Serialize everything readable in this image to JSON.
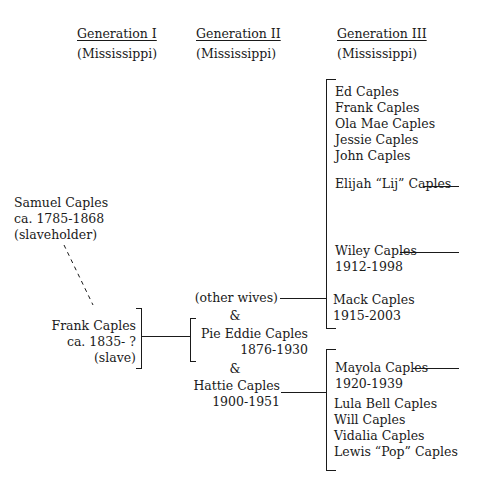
{
  "headers": [
    {
      "title": "Generation I",
      "region": "(Mississippi)"
    },
    {
      "title": "Generation II",
      "region": "(Mississippi)"
    },
    {
      "title": "Generation III",
      "region": "(Mississippi)"
    }
  ],
  "generation1": {
    "samuel": {
      "name": "Samuel Caples",
      "dates": "ca. 1785-1868",
      "note": "(slaveholder)"
    },
    "frank": {
      "name": "Frank Caples",
      "dates": "ca. 1835- ?",
      "note": "(slave)"
    }
  },
  "generation2": {
    "other_wives": "(other wives)",
    "amp1": "&",
    "pie": {
      "name": "Pie Eddie Caples",
      "dates": "1876-1930"
    },
    "amp2": "&",
    "hattie": {
      "name": "Hattie Caples",
      "dates": "1900-1951"
    }
  },
  "generation3": {
    "group1": [
      "Ed Caples",
      "Frank Caples",
      "Ola Mae Caples",
      "Jessie Caples",
      "John Caples"
    ],
    "elijah": "Elijah “Lij” Caples",
    "wiley": {
      "name": "Wiley Caples",
      "dates": "1912-1998"
    },
    "mack": {
      "name": "Mack Caples",
      "dates": "1915-2003"
    },
    "mayola": {
      "name": "Mayola Caples",
      "dates": "1920-1939"
    },
    "group2": [
      "Lula Bell Caples",
      "Will Caples",
      "Vidalia Caples",
      "Lewis “Pop” Caples"
    ]
  }
}
